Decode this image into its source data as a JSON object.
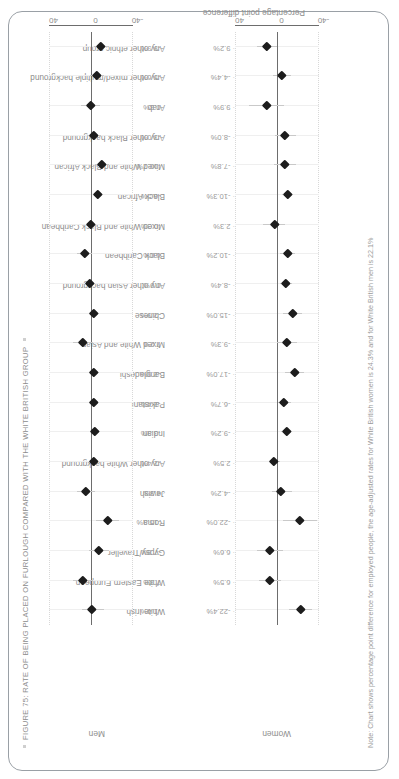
{
  "figure": {
    "title": "FIGURE 75: RATE OF BEING PLACED ON FURLOUGH COMPARED WITH THE WHITE BRITISH GROUP",
    "note": "Note: Chart shows percentage point difference for employed people, the age-adjusted rates for White British women is 24.3% and for White British men is 22.1%",
    "axis_caption": "Percentage point difference",
    "panel_women_title": "Women",
    "panel_men_title": "Men",
    "tick_labels": [
      "-40",
      "0",
      "40"
    ],
    "bullet_icon": "square-bullet"
  },
  "chart_data": {
    "type": "scatter",
    "title": "FIGURE 75: RATE OF BEING PLACED ON FURLOUGH COMPARED WITH THE WHITE BRITISH GROUP",
    "subtitle": "",
    "xlabel": "",
    "ylabel": "Percentage point difference",
    "ylim": [
      -40,
      40
    ],
    "yticks": [
      -40,
      0,
      40
    ],
    "grid": true,
    "legend": "none",
    "reference_line": 0,
    "panels": [
      "Women",
      "Men"
    ],
    "categories": [
      "White Irish",
      "White Eastern European",
      "Gypsy/Traveller",
      "Roma",
      "Jewish",
      "Any other White background",
      "Indian",
      "Pakistani",
      "Bangladeshi",
      "Mixed White and Asian",
      "Chinese",
      "Any other Asian background",
      "Black Caribbean",
      "Mixed White and Black Caribbean",
      "Black African",
      "Mixed White and Black African",
      "Any other Black background",
      "Arab",
      "Any other mixed/multiple background",
      "Any other ethnic group"
    ],
    "series": [
      {
        "name": "Women",
        "value_labels": [
          "-22.4%",
          "6.5%",
          "6.6%",
          "-22.0%",
          "-4.2%",
          "2.5%",
          "-9.2%",
          "-6.7%",
          "-17.0%",
          "-9.3%",
          "-15.0%",
          "-8.4%",
          "-10.2%",
          "2.3%",
          "-10.3%",
          "-7.8%",
          "-8.0%",
          "9.9%",
          "-4.4%",
          "9.2%"
        ],
        "values": [
          -22.4,
          6.5,
          6.6,
          -22.0,
          -4.2,
          2.5,
          -9.2,
          -6.7,
          -17.0,
          -9.3,
          -15.0,
          -8.4,
          -10.2,
          2.3,
          -10.3,
          -7.8,
          -8.0,
          9.9,
          -4.4,
          9.2
        ],
        "ci_low": [
          -33.0,
          -4.0,
          -6.0,
          -38.0,
          -14.0,
          -3.0,
          -14.0,
          -13.0,
          -26.0,
          -19.0,
          -24.0,
          -14.0,
          -17.0,
          -8.0,
          -15.0,
          -18.0,
          -18.0,
          -7.0,
          -13.0,
          0.0
        ],
        "ci_high": [
          -11.0,
          17.0,
          19.0,
          -6.0,
          5.0,
          8.0,
          -4.0,
          -0.5,
          -8.0,
          0.0,
          -6.0,
          -3.0,
          -3.0,
          13.0,
          -5.0,
          3.0,
          2.0,
          27.0,
          4.0,
          19.0
        ]
      },
      {
        "name": "Men",
        "value_labels": [
          "-1.4%",
          "7.3%",
          "-7.8%",
          "-15.9%",
          "4.3%",
          "-2.4%",
          "-3.9%",
          "-2.4%",
          "-2.9%",
          "7.2%",
          "-2.9%",
          "0.9%",
          "6.0%",
          "-0.3%",
          "-6.5%",
          "-10.7%",
          "-3.0%",
          "0.3%",
          "-5.6%",
          "-9.9%"
        ],
        "values": [
          -1.4,
          7.3,
          -7.8,
          -15.9,
          4.3,
          -2.4,
          -3.9,
          -2.4,
          -2.9,
          7.2,
          -2.9,
          0.9,
          6.0,
          -0.3,
          -6.5,
          -10.7,
          -3.0,
          0.3,
          -5.6,
          -9.9
        ],
        "ci_low": [
          -12.0,
          -2.0,
          -17.0,
          -27.0,
          -4.0,
          -7.0,
          -9.0,
          -7.0,
          -8.0,
          -2.0,
          -8.0,
          -4.0,
          -1.0,
          -5.0,
          -11.0,
          -17.0,
          -10.0,
          -9.0,
          -12.0,
          -17.0
        ],
        "ci_high": [
          9.0,
          17.0,
          2.0,
          -5.0,
          13.0,
          2.0,
          1.0,
          2.0,
          2.0,
          17.0,
          2.0,
          6.0,
          13.0,
          4.0,
          -2.0,
          -4.0,
          4.0,
          10.0,
          1.0,
          -3.0
        ]
      }
    ]
  }
}
